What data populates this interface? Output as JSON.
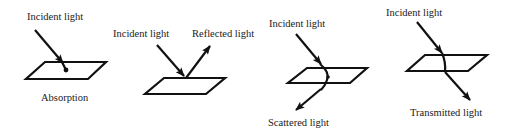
{
  "colors": {
    "stroke": "#111111",
    "text": "#1a1a1a",
    "background": "#ffffff"
  },
  "panels": [
    {
      "id": "absorption",
      "labels": {
        "incident": "Incident light",
        "caption": "Absorption"
      }
    },
    {
      "id": "reflection",
      "labels": {
        "incident": "Incident light",
        "outgoing": "Reflected light"
      }
    },
    {
      "id": "scattering",
      "labels": {
        "incident": "Incident light",
        "outgoing": "Scattered light"
      }
    },
    {
      "id": "transmission",
      "labels": {
        "incident": "Incident light",
        "outgoing": "Transmitted light"
      }
    }
  ]
}
